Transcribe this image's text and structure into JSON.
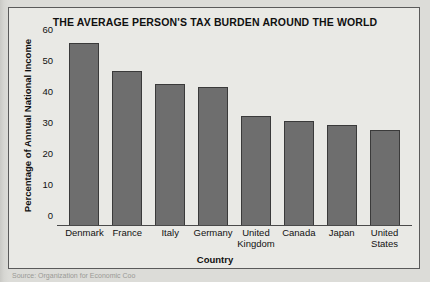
{
  "chart_data": {
    "type": "bar",
    "title": "THE AVERAGE PERSON'S TAX BURDEN AROUND THE WORLD",
    "xlabel": "Country",
    "ylabel": "Percentage of Annual National Income",
    "categories": [
      "Denmark",
      "France",
      "Italy",
      "Germany",
      "United Kingdom",
      "Canada",
      "Japan",
      "United States"
    ],
    "values": [
      59,
      50,
      46,
      45,
      35.5,
      34,
      32.5,
      31
    ],
    "ylim": [
      0,
      62
    ],
    "yticks": [
      0,
      10,
      20,
      30,
      40,
      50,
      60
    ],
    "grid": false,
    "legend": null,
    "bar_color": "#6e6e6e",
    "bar_border_color": "#3a3a3a",
    "background_color": "#e9e9e5"
  },
  "source": {
    "text": "Source: Organization for Economic Coo"
  }
}
